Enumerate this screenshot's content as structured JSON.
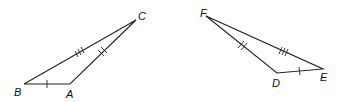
{
  "figure": {
    "triangles": [
      {
        "name": "ABC",
        "vertices": {
          "B": {
            "label": "B",
            "x": 24,
            "y": 84
          },
          "A": {
            "label": "A",
            "x": 70,
            "y": 84
          },
          "C": {
            "label": "C",
            "x": 136,
            "y": 20
          }
        },
        "sides": [
          {
            "from": "B",
            "to": "A",
            "ticks": 1
          },
          {
            "from": "A",
            "to": "C",
            "ticks": 2
          },
          {
            "from": "B",
            "to": "C",
            "ticks": 3
          }
        ]
      },
      {
        "name": "DEF",
        "vertices": {
          "F": {
            "label": "F",
            "x": 206,
            "y": 16
          },
          "D": {
            "label": "D",
            "x": 277,
            "y": 73
          },
          "E": {
            "label": "E",
            "x": 323,
            "y": 69
          }
        },
        "sides": [
          {
            "from": "D",
            "to": "E",
            "ticks": 1
          },
          {
            "from": "F",
            "to": "D",
            "ticks": 2
          },
          {
            "from": "F",
            "to": "E",
            "ticks": 3
          }
        ]
      }
    ],
    "colors": {
      "stroke": "#222222",
      "background": "#ffffff"
    }
  }
}
